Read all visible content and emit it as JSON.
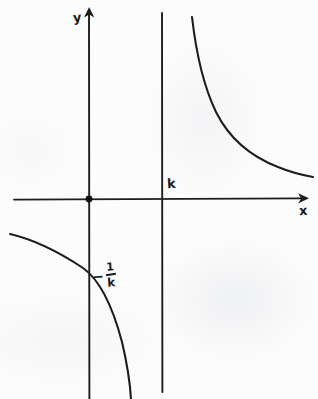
{
  "figure": {
    "background_color": "#fcfcfc",
    "ink_color": "#1d1d1d",
    "width": 318,
    "height": 399
  },
  "labels": {
    "y_axis": "y",
    "x_axis": "x",
    "asymptote": "k",
    "y_intercept_minus": "−",
    "y_intercept_numerator": "1",
    "y_intercept_denominator": "k"
  },
  "chart_data": {
    "type": "line",
    "xlabel": "x",
    "ylabel": "y",
    "grid": false,
    "legend": false,
    "annotations": [
      {
        "text": "k",
        "meaning": "vertical asymptote at x = k",
        "pixel_x": 170,
        "pixel_y": 185
      },
      {
        "text": "-1/k",
        "meaning": "y-intercept at y = -1/k",
        "pixel_x": 105,
        "pixel_y": 275
      },
      {
        "text": "y",
        "meaning": "y-axis label",
        "pixel_x": 78,
        "pixel_y": 18
      },
      {
        "text": "x",
        "meaning": "x-axis label",
        "pixel_x": 303,
        "pixel_y": 212
      }
    ],
    "axes": {
      "x_axis_pixel_y": 199,
      "x_axis_pixel_x_start": 14,
      "x_axis_pixel_x_end": 305,
      "y_axis_pixel_x": 89,
      "y_axis_pixel_y_start": 8,
      "y_axis_pixel_y_end": 399,
      "origin_pixel": [
        89,
        199
      ]
    },
    "asymptotes": [
      {
        "kind": "vertical",
        "label": "k",
        "pixel_x": 162,
        "pixel_y_start": 13,
        "pixel_y_end": 392
      },
      {
        "kind": "horizontal",
        "label": "x-axis",
        "pixel_y": 199
      }
    ],
    "points_of_interest": [
      {
        "name": "origin-marker",
        "pixel": [
          89,
          199
        ],
        "marker": "filled-dot"
      },
      {
        "name": "y-intercept",
        "label": "-1/k",
        "pixel": [
          89,
          272
        ]
      }
    ],
    "series": [
      {
        "name": "right-branch",
        "description": "Branch in the region x > k, decreasing from near the asymptote down toward the x-axis",
        "path": "M 192 17 C 196 52, 203 85, 216 112 C 230 140, 252 157, 278 167 C 290 172, 302 175, 313 177",
        "pixel_points": [
          [
            192,
            17
          ],
          [
            198,
            62
          ],
          [
            207,
            95
          ],
          [
            220,
            122
          ],
          [
            240,
            148
          ],
          [
            268,
            164
          ],
          [
            292,
            172
          ],
          [
            313,
            177
          ]
        ]
      },
      {
        "name": "left-branch",
        "description": "Branch in the region x < k, falling from upper-left through the y-axis at -1/k and steepening downward",
        "path": "M 10 234 C 36 240, 62 254, 83 268 C 100 280, 113 308, 122 342 C 127 363, 130 383, 131 399",
        "pixel_points": [
          [
            10,
            234
          ],
          [
            40,
            242
          ],
          [
            66,
            257
          ],
          [
            89,
            272
          ],
          [
            108,
            296
          ],
          [
            120,
            334
          ],
          [
            127,
            368
          ],
          [
            131,
            399
          ]
        ]
      }
    ]
  }
}
